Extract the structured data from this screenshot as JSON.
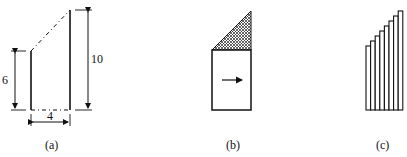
{
  "figures": [
    {
      "id": "a",
      "caption": "(a)",
      "dimensions": {
        "short_height": "6",
        "tall_height": "10",
        "width": "4"
      }
    },
    {
      "id": "b",
      "caption": "(b)"
    },
    {
      "id": "c",
      "caption": "(c)",
      "strip_count": 9
    }
  ]
}
